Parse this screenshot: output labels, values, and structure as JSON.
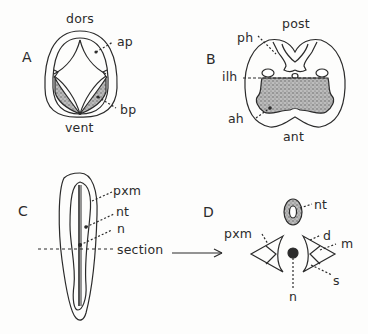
{
  "figure": {
    "panels": [
      {
        "id": "A",
        "letter": "A",
        "labels": {
          "top": "dors",
          "bottom": "vent",
          "ap": "ap",
          "bp": "bp"
        }
      },
      {
        "id": "B",
        "letter": "B",
        "labels": {
          "top": "post",
          "bottom": "ant",
          "ph": "ph",
          "ilh": "ilh",
          "ah": "ah"
        }
      },
      {
        "id": "C",
        "letter": "C",
        "labels": {
          "pxm": "pxm",
          "nt": "nt",
          "n": "n",
          "section": "section"
        }
      },
      {
        "id": "D",
        "letter": "D",
        "labels": {
          "nt": "nt",
          "pxm": "pxm",
          "d": "d",
          "m": "m",
          "s": "s",
          "n": "n"
        }
      }
    ],
    "colors": {
      "ink": "#2b2b2b",
      "stipple": "#8a8a8a",
      "background": "#fdfdfc"
    }
  }
}
